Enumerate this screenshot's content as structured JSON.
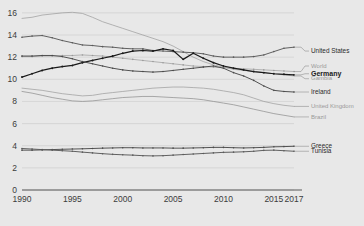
{
  "chart_data": {
    "type": "line",
    "title": "",
    "subtitle": "",
    "xlabel": "",
    "ylabel": "",
    "xlim": [
      1990,
      2017
    ],
    "ylim": [
      0,
      16.8
    ],
    "grid": true,
    "legend_position": "right",
    "x": [
      1990,
      1991,
      1992,
      1993,
      1994,
      1995,
      1996,
      1997,
      1998,
      1999,
      2000,
      2001,
      2002,
      2003,
      2004,
      2005,
      2006,
      2007,
      2008,
      2009,
      2010,
      2011,
      2012,
      2013,
      2014,
      2015,
      2016,
      2017
    ],
    "y_ticks": [
      0,
      2,
      4,
      6,
      8,
      10,
      12,
      14,
      16
    ],
    "x_ticks": [
      1990,
      1995,
      2000,
      2005,
      2010,
      2015,
      2017
    ],
    "x_tick_labels": [
      "1990",
      "1995",
      "2000",
      "2005",
      "2010",
      "2015",
      "2017"
    ],
    "y_tick_labels": [
      "0",
      "2",
      "4",
      "6",
      "8",
      "10",
      "12",
      "14",
      "16"
    ],
    "series": [
      {
        "name": "Gambia",
        "label": "Gambia",
        "color": "#9a9a9a",
        "emphasis": "faint",
        "markers": false,
        "label_y": 10.05,
        "values": [
          15.5,
          15.6,
          15.8,
          15.9,
          16.0,
          16.05,
          15.95,
          15.6,
          15.2,
          14.9,
          14.6,
          14.3,
          14.0,
          13.7,
          13.4,
          13.0,
          12.5,
          12.0,
          11.6,
          11.3,
          11.1,
          10.9,
          10.8,
          10.7,
          10.6,
          10.5,
          10.4,
          10.3
        ]
      },
      {
        "name": "United States",
        "label": "United States",
        "color": "#5a5a5a",
        "emphasis": "normal",
        "markers": true,
        "label_y": 12.55,
        "values": [
          13.8,
          13.9,
          13.95,
          13.75,
          13.5,
          13.3,
          13.1,
          13.05,
          12.95,
          12.9,
          12.8,
          12.75,
          12.75,
          12.6,
          12.55,
          12.5,
          12.45,
          12.4,
          12.3,
          12.1,
          12.0,
          12.0,
          12.0,
          12.05,
          12.2,
          12.5,
          12.8,
          12.9
        ]
      },
      {
        "name": "World",
        "label": "World",
        "color": "#9a9a9a",
        "emphasis": "faint",
        "markers": true,
        "label_y": 11.2,
        "values": [
          12.05,
          12.05,
          12.1,
          12.1,
          12.15,
          12.15,
          12.2,
          12.15,
          12.1,
          12.0,
          11.9,
          11.8,
          11.7,
          11.6,
          11.5,
          11.4,
          11.3,
          11.2,
          11.15,
          11.1,
          11.05,
          11.0,
          10.95,
          10.9,
          10.85,
          10.8,
          10.75,
          10.7
        ]
      },
      {
        "name": "Germany",
        "label": "Germany",
        "color": "#1a1a1a",
        "emphasis": "bold",
        "markers": true,
        "label_y": 10.5,
        "values": [
          10.2,
          10.5,
          10.8,
          11.0,
          11.15,
          11.25,
          11.5,
          11.7,
          11.9,
          12.1,
          12.35,
          12.55,
          12.6,
          12.55,
          12.75,
          12.6,
          11.8,
          12.35,
          11.9,
          11.5,
          11.2,
          11.0,
          10.85,
          10.7,
          10.6,
          10.5,
          10.45,
          10.4
        ]
      },
      {
        "name": "Ireland",
        "label": "Ireland",
        "color": "#4a4a4a",
        "emphasis": "normal",
        "markers": true,
        "label_y": 8.85,
        "values": [
          12.1,
          12.1,
          12.15,
          12.15,
          12.05,
          11.85,
          11.6,
          11.4,
          11.2,
          11.0,
          10.85,
          10.75,
          10.7,
          10.65,
          10.7,
          10.8,
          10.9,
          11.0,
          11.1,
          11.2,
          11.0,
          10.6,
          10.3,
          9.9,
          9.4,
          9.0,
          8.9,
          8.85
        ]
      },
      {
        "name": "United Kingdom",
        "label": "United Kingdom",
        "color": "#9a9a9a",
        "emphasis": "faint",
        "markers": false,
        "label_y": 7.55,
        "values": [
          9.2,
          9.1,
          9.0,
          8.85,
          8.7,
          8.6,
          8.5,
          8.55,
          8.7,
          8.8,
          8.9,
          9.0,
          9.1,
          9.2,
          9.25,
          9.3,
          9.3,
          9.25,
          9.2,
          9.1,
          8.95,
          8.8,
          8.6,
          8.3,
          8.0,
          7.8,
          7.65,
          7.55
        ]
      },
      {
        "name": "Brazil",
        "label": "Brazil",
        "color": "#8a8a8a",
        "emphasis": "faint",
        "markers": false,
        "label_y": 6.6,
        "values": [
          8.9,
          8.75,
          8.55,
          8.35,
          8.2,
          8.05,
          8.0,
          8.05,
          8.15,
          8.25,
          8.35,
          8.4,
          8.45,
          8.45,
          8.4,
          8.35,
          8.3,
          8.25,
          8.15,
          8.0,
          7.85,
          7.7,
          7.5,
          7.3,
          7.1,
          6.9,
          6.75,
          6.6
        ]
      },
      {
        "name": "Greece",
        "label": "Greece",
        "color": "#4a4a4a",
        "emphasis": "normal",
        "markers": true,
        "label_y": 3.95,
        "values": [
          3.6,
          3.6,
          3.62,
          3.65,
          3.68,
          3.7,
          3.72,
          3.75,
          3.78,
          3.8,
          3.82,
          3.82,
          3.8,
          3.8,
          3.8,
          3.78,
          3.78,
          3.8,
          3.82,
          3.85,
          3.85,
          3.82,
          3.8,
          3.82,
          3.85,
          3.9,
          3.92,
          3.95
        ]
      },
      {
        "name": "Tunisia",
        "label": "Tunisia",
        "color": "#5a5a5a",
        "emphasis": "normal",
        "markers": true,
        "label_y": 3.5,
        "values": [
          3.75,
          3.7,
          3.65,
          3.6,
          3.55,
          3.5,
          3.42,
          3.35,
          3.28,
          3.22,
          3.18,
          3.15,
          3.1,
          3.08,
          3.1,
          3.15,
          3.2,
          3.25,
          3.3,
          3.35,
          3.4,
          3.42,
          3.45,
          3.5,
          3.58,
          3.6,
          3.55,
          3.5
        ]
      }
    ],
    "legend_entries": [
      {
        "label": "United States",
        "style": "normal"
      },
      {
        "label": "World",
        "style": "faint"
      },
      {
        "label": "Germany",
        "style": "bold"
      },
      {
        "label": "Gambia",
        "style": "faint"
      },
      {
        "label": "Ireland",
        "style": "normal"
      },
      {
        "label": "United Kingdom",
        "style": "faint"
      },
      {
        "label": "Brazil",
        "style": "faint"
      },
      {
        "label": "Greece",
        "style": "normal"
      },
      {
        "label": "Tunisia",
        "style": "normal"
      }
    ]
  },
  "colors": {
    "background": "#e8e8e8",
    "grid": "#c9c9c9",
    "axis": "#4a4a4a",
    "text": "#3c3c3c"
  }
}
